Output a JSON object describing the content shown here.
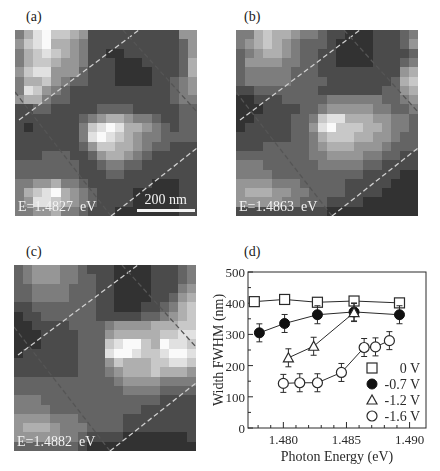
{
  "figure": {
    "panels": [
      {
        "label": "(a)",
        "energy_label": "E=1.4827  eV",
        "scale_bar_label": "200 nm",
        "grid": [
          "46897765222222222255",
          "57896654222222222235",
          "46787654221122222235",
          "46776554222111222236",
          "57885553222111122236",
          "46675433222111122345",
          "48754322222222222345",
          "56643322222222222344",
          "22332222233332222233",
          "22222223456654432233",
          "21222224789866543233",
          "22222224898765443333",
          "22222223577665433222",
          "22233322356654322222",
          "33333332234433222222",
          "33333332223322222222",
          "44556443222222211122",
          "46789654322221111122",
          "45887654322221111122",
          "44556443222111111122"
        ]
      },
      {
        "label": "(b)",
        "energy_label": "E=1.4863  eV",
        "scale_bar_label": "",
        "grid": [
          "44676654432211122234",
          "45676543332111122235",
          "34566543322111122223",
          "35555443322111122234",
          "34444433322222222256",
          "34444433332222222367",
          "22333333322222223356",
          "11222333334444443345",
          "11122223345555544334",
          "11222233478866655443",
          "12222233589777665443",
          "22222233467776655433",
          "22233333456665554333",
          "33333333445555443322",
          "44433333344444332222",
          "44443333333333222211",
          "55554443333322222111",
          "56665544333322221111",
          "55555443332222111111",
          "22222222221111111111"
        ]
      },
      {
        "label": "(c)",
        "energy_label": "E=1.4882  eV",
        "scale_bar_label": "",
        "grid": [
          "34555443222111122234",
          "34555443322111122234",
          "33444433322111122245",
          "33444433322111122356",
          "22333333322111223467",
          "12233333322222334567",
          "11222233334555566677",
          "11122223335666667788",
          "11122223337899769887",
          "12222223338998778998",
          "22222223335766677887",
          "22222223334566676665",
          "33333333333455554444",
          "33333333333344443333",
          "44433333333333332222",
          "44443333333333222222",
          "55554443333322222222",
          "56665444333322222222",
          "55555443222211111112",
          "33333332111111111111"
        ]
      }
    ]
  },
  "chart_data": {
    "panel_label": "(d)",
    "type": "scatter",
    "title": "",
    "xlabel": "Photon Energy (eV)",
    "ylabel": "Width FWHM (nm)",
    "xlim": [
      1.4772,
      1.4913
    ],
    "ylim": [
      0,
      500
    ],
    "xticks": [
      1.48,
      1.485,
      1.49
    ],
    "xtick_labels": [
      "1.480",
      "1.485",
      "1.490"
    ],
    "yticks": [
      0,
      100,
      200,
      300,
      400,
      500
    ],
    "ytick_labels": [
      "0",
      "100",
      "200",
      "300",
      "400",
      "500"
    ],
    "grid": false,
    "legend_position": "lower right",
    "series": [
      {
        "name": "0 V",
        "marker": "open-square",
        "x": [
          1.4777,
          1.4801,
          1.4827,
          1.4856,
          1.4892
        ],
        "y": [
          405,
          412,
          403,
          407,
          401
        ]
      },
      {
        "name": "-0.7 V",
        "marker": "filled-circle",
        "x": [
          1.4781,
          1.4801,
          1.4827,
          1.4856,
          1.4892
        ],
        "y": [
          305,
          335,
          363,
          372,
          363
        ]
      },
      {
        "name": "-1.2 V",
        "marker": "open-triangle",
        "x": [
          1.4804,
          1.4824,
          1.4856
        ],
        "y": [
          225,
          262,
          370
        ]
      },
      {
        "name": "-1.6 V",
        "marker": "open-circle",
        "x": [
          1.48,
          1.4813,
          1.4827,
          1.4846,
          1.4864,
          1.4873,
          1.4884
        ],
        "y": [
          143,
          145,
          145,
          178,
          258,
          260,
          280
        ]
      }
    ]
  }
}
